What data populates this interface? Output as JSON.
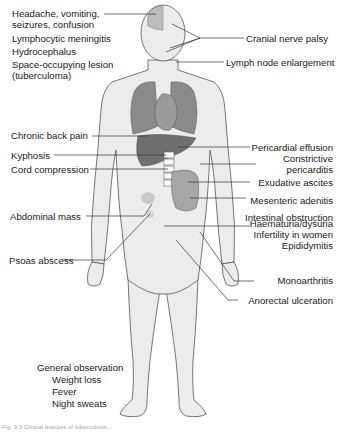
{
  "figure": {
    "caption_fragment": "Fig. 9.3 Clinical features of tuberculosis...",
    "colors": {
      "skin": "#ececec",
      "outline": "#555555",
      "organ": "#8a8a8a",
      "organ_dark": "#6f6f6f",
      "text": "#1a1a1a",
      "leader": "#333333"
    }
  },
  "labels_left": {
    "head": {
      "line1": "Headache, vomiting,",
      "line2": "seizures, confusion"
    },
    "meningitis": "Lymphocytic meningitis",
    "hydrocephalus": "Hydrocephalus",
    "lesion": {
      "line1": "Space-occupying lesion",
      "line2": "(tuberculoma)"
    },
    "back_pain": "Chronic back pain",
    "kyphosis": "Kyphosis",
    "cord": "Cord compression",
    "abdominal_mass": "Abdominal mass",
    "psoas": "Psoas abscess"
  },
  "labels_right": {
    "cranial": "Cranial nerve palsy",
    "lymph": "Lymph node enlargement",
    "pericardial": {
      "line1": "Pericardial effusion",
      "line2": "Constrictive",
      "line3": "pericarditis"
    },
    "ascites": "Exudative ascites",
    "mesenteric": "Mesenteric adenitis",
    "intestinal": "Intestinal obstruction",
    "genito": {
      "line1": "Haematuria/dysuria",
      "line2": "Infertility in women",
      "line3": "Epididymitis"
    },
    "monoarthritis": "Monoarthritis",
    "anorectal": "Anorectal ulceration"
  },
  "general": {
    "heading": "General observation",
    "items": [
      "Weight loss",
      "Fever",
      "Night sweats"
    ]
  }
}
